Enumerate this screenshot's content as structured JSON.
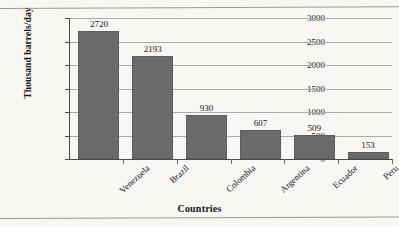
{
  "chart_data": {
    "type": "bar",
    "title": "",
    "xlabel": "Countries",
    "ylabel": "Thousand barrels/day",
    "categories": [
      "Venezuela",
      "Brazil",
      "Colombia",
      "Argentina",
      "Ecuador",
      "Peru"
    ],
    "values": [
      2720,
      2193,
      930,
      607,
      509,
      153
    ],
    "value_labels": [
      "2720",
      "2193",
      "930",
      "607",
      "509",
      "153"
    ],
    "ylim": [
      0,
      3000
    ],
    "yticks": [
      0,
      500,
      1000,
      1500,
      2000,
      2500,
      3000
    ],
    "ytick_labels": [
      "0",
      "500",
      "1000",
      "1500",
      "2000",
      "2500",
      "3000"
    ],
    "grid": true,
    "legend": false,
    "bar_color": "#6b6b6b",
    "grid_color": "#a9a9a7",
    "axis_color": "#4a4a48",
    "background": "#f8f7f4"
  }
}
